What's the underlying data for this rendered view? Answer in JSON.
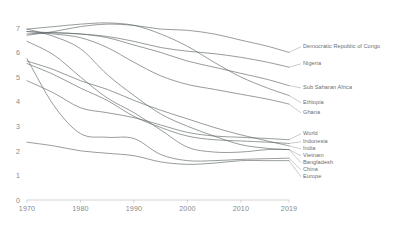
{
  "chart_data": {
    "type": "line",
    "title": "",
    "subtitle": "",
    "xlabel": "",
    "ylabel": "",
    "xlim": [
      1970,
      2019
    ],
    "ylim": [
      0,
      7.4
    ],
    "grid": false,
    "legend_position": "right-inline-labels",
    "x_ticks": [
      "1970",
      "1980",
      "1990",
      "2000",
      "2010",
      "2019"
    ],
    "x_tick_values": [
      1970,
      1980,
      1990,
      2000,
      2010,
      2019
    ],
    "y_ticks": [
      "0",
      "1",
      "2",
      "3",
      "4",
      "5",
      "6",
      "7"
    ],
    "y_tick_values": [
      0,
      1,
      2,
      3,
      4,
      5,
      6,
      7
    ],
    "x": [
      1970,
      1975,
      1980,
      1985,
      1990,
      1995,
      2000,
      2005,
      2010,
      2015,
      2019
    ],
    "series": [
      {
        "name": "Democratic Republic of Congo",
        "values": [
          6.7,
          6.85,
          7.05,
          7.15,
          7.1,
          6.95,
          6.9,
          6.75,
          6.5,
          6.25,
          6.0
        ]
      },
      {
        "name": "Nigeria",
        "values": [
          6.85,
          6.8,
          6.75,
          6.65,
          6.45,
          6.2,
          6.05,
          5.95,
          5.8,
          5.6,
          5.4
        ]
      },
      {
        "name": "Sub Saharan Africa",
        "values": [
          6.75,
          6.8,
          6.75,
          6.6,
          6.3,
          6.0,
          5.65,
          5.4,
          5.15,
          4.9,
          4.65
        ]
      },
      {
        "name": "Ethiopia",
        "values": [
          6.95,
          7.05,
          7.15,
          7.2,
          7.1,
          6.75,
          6.25,
          5.6,
          5.0,
          4.55,
          4.25
        ]
      },
      {
        "name": "Ghana",
        "values": [
          6.85,
          6.75,
          6.6,
          6.2,
          5.6,
          5.05,
          4.7,
          4.5,
          4.3,
          4.1,
          3.9
        ]
      },
      {
        "name": "World",
        "values": [
          4.85,
          4.35,
          3.75,
          3.55,
          3.35,
          3.05,
          2.75,
          2.6,
          2.55,
          2.5,
          2.45
        ]
      },
      {
        "name": "Indonesia",
        "values": [
          5.55,
          5.1,
          4.55,
          4.05,
          3.4,
          2.95,
          2.6,
          2.45,
          2.4,
          2.35,
          2.3
        ]
      },
      {
        "name": "India",
        "values": [
          5.65,
          5.3,
          4.85,
          4.5,
          4.05,
          3.65,
          3.3,
          2.95,
          2.65,
          2.4,
          2.2
        ]
      },
      {
        "name": "Vietnam",
        "values": [
          6.45,
          5.9,
          5.0,
          4.15,
          3.55,
          2.85,
          2.15,
          1.95,
          1.95,
          2.05,
          2.05
        ]
      },
      {
        "name": "Bangladesh",
        "values": [
          6.95,
          6.65,
          6.15,
          5.1,
          4.25,
          3.5,
          3.0,
          2.6,
          2.25,
          2.1,
          2.05
        ]
      },
      {
        "name": "China",
        "values": [
          5.75,
          3.85,
          2.7,
          2.55,
          2.5,
          1.85,
          1.6,
          1.6,
          1.65,
          1.68,
          1.7
        ]
      },
      {
        "name": "Europe",
        "values": [
          2.35,
          2.2,
          2.0,
          1.9,
          1.8,
          1.55,
          1.45,
          1.5,
          1.6,
          1.6,
          1.6
        ]
      }
    ]
  },
  "axis": {
    "y_labels": [
      {
        "text": "7",
        "value": 7
      },
      {
        "text": "6",
        "value": 6
      },
      {
        "text": "5",
        "value": 5
      },
      {
        "text": "4",
        "value": 4
      },
      {
        "text": "3",
        "value": 3
      },
      {
        "text": "2",
        "value": 2
      },
      {
        "text": "1",
        "value": 1
      },
      {
        "text": "0",
        "value": 0
      }
    ],
    "x_labels": [
      {
        "text": "1970",
        "value": 1970
      },
      {
        "text": "1980",
        "value": 1980
      },
      {
        "text": "1990",
        "value": 1990
      },
      {
        "text": "2000",
        "value": 2000
      },
      {
        "text": "2010",
        "value": 2010
      },
      {
        "text": "2019",
        "value": 2019
      }
    ]
  },
  "labels": {
    "group_top": [
      {
        "text": "Democratic Republic of Congo"
      },
      {
        "text": "Nigeria"
      },
      {
        "text": "Sub Saharan Africa"
      },
      {
        "text": "Ethiopia"
      },
      {
        "text": "Ghana"
      }
    ],
    "group_bottom": [
      {
        "text": "World"
      },
      {
        "text": "Indonesia"
      },
      {
        "text": "India"
      },
      {
        "text": "Vietnam"
      },
      {
        "text": "Bangladesh"
      },
      {
        "text": "China"
      },
      {
        "text": "Europe"
      }
    ]
  },
  "colors": {
    "line": "#5f6668",
    "axis": "#b5b5b5",
    "tick_text": "#8a8a8a",
    "label_text": "#6e6e6e",
    "background": "#ffffff"
  }
}
